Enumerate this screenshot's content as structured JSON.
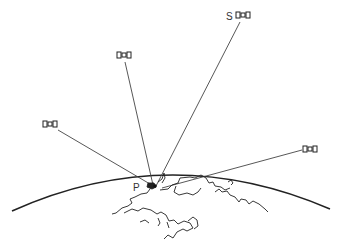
{
  "diagram": {
    "labels": {
      "satellite_s": "S",
      "point_p": "P"
    },
    "satellites": [
      {
        "id": "sat-s",
        "x": 243,
        "y": 16
      },
      {
        "id": "sat-upper-left",
        "x": 124,
        "y": 56
      },
      {
        "id": "sat-left",
        "x": 50,
        "y": 125
      },
      {
        "id": "sat-right",
        "x": 311,
        "y": 149
      }
    ],
    "point_p": {
      "x": 153,
      "y": 186
    },
    "colors": {
      "line": "#333333",
      "earth": "#222222"
    }
  }
}
